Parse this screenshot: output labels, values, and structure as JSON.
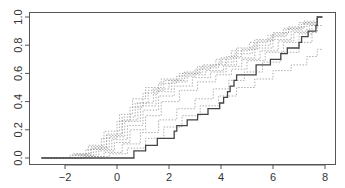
{
  "chart_data": {
    "type": "line",
    "subtype": "empirical-cdf-step",
    "title": "",
    "xlabel": "",
    "ylabel": "",
    "xlim": [
      -3.4,
      8.4
    ],
    "ylim": [
      -0.04,
      1.04
    ],
    "x_ticks": [
      -2,
      0,
      2,
      4,
      6,
      8
    ],
    "y_ticks": [
      0.0,
      0.2,
      0.4,
      0.6,
      0.8,
      1.0
    ],
    "x_tick_labels": [
      "−2",
      "0",
      "2",
      "4",
      "6",
      "8"
    ],
    "y_tick_labels": [
      "0.0",
      "0.2",
      "0.4",
      "0.6",
      "0.8",
      "1.0"
    ],
    "grid": false,
    "legend": null,
    "colors": {
      "axis": "#555555",
      "solid_series": "#444444",
      "dashed_series": "#9a9a9a"
    },
    "series": [
      {
        "name": "observed-ecdf",
        "style": "solid",
        "x": [
          -2.9,
          0.65,
          1.1,
          1.55,
          2.2,
          2.3,
          2.7,
          3.1,
          3.5,
          3.95,
          4.1,
          4.25,
          4.35,
          4.5,
          4.6,
          5.35,
          5.9,
          6.3,
          6.55,
          7.0,
          7.1,
          7.35,
          7.65,
          7.7
        ],
        "y": [
          0.0,
          0.05,
          0.09,
          0.14,
          0.19,
          0.23,
          0.27,
          0.31,
          0.35,
          0.39,
          0.43,
          0.47,
          0.51,
          0.55,
          0.59,
          0.66,
          0.7,
          0.74,
          0.78,
          0.82,
          0.86,
          0.9,
          0.94,
          1.0
        ]
      },
      {
        "name": "sim-1",
        "style": "dashed",
        "x": [
          -2.9,
          -1.8,
          -1.2,
          -0.6,
          0.0,
          0.5,
          1.0,
          1.6,
          2.3,
          3.0,
          3.6,
          4.2,
          4.8,
          5.4,
          6.0,
          6.6,
          7.2,
          7.7
        ],
        "y": [
          0.0,
          0.02,
          0.06,
          0.14,
          0.26,
          0.36,
          0.46,
          0.53,
          0.58,
          0.63,
          0.66,
          0.72,
          0.77,
          0.83,
          0.88,
          0.92,
          0.96,
          1.0
        ]
      },
      {
        "name": "sim-2",
        "style": "dashed",
        "x": [
          -2.9,
          -1.6,
          -1.0,
          -0.4,
          0.2,
          0.7,
          1.2,
          1.8,
          2.5,
          3.2,
          3.9,
          4.5,
          5.2,
          5.9,
          6.5,
          7.1,
          7.7
        ],
        "y": [
          0.0,
          0.03,
          0.08,
          0.17,
          0.29,
          0.39,
          0.48,
          0.55,
          0.6,
          0.64,
          0.68,
          0.74,
          0.8,
          0.86,
          0.91,
          0.95,
          1.0
        ]
      },
      {
        "name": "sim-3",
        "style": "dashed",
        "x": [
          -2.9,
          -1.5,
          -0.9,
          -0.3,
          0.3,
          0.9,
          1.5,
          2.1,
          2.7,
          3.4,
          4.1,
          4.6,
          5.3,
          6.0,
          6.7,
          7.3,
          7.7
        ],
        "y": [
          0.0,
          0.02,
          0.07,
          0.15,
          0.26,
          0.37,
          0.47,
          0.54,
          0.59,
          0.62,
          0.66,
          0.71,
          0.78,
          0.84,
          0.9,
          0.95,
          1.0
        ]
      },
      {
        "name": "sim-4",
        "style": "dashed",
        "x": [
          -2.9,
          -1.7,
          -1.1,
          -0.5,
          0.1,
          0.6,
          1.1,
          1.7,
          2.4,
          3.1,
          3.8,
          4.4,
          5.1,
          5.8,
          6.4,
          7.0,
          7.7
        ],
        "y": [
          0.0,
          0.03,
          0.09,
          0.19,
          0.31,
          0.42,
          0.5,
          0.56,
          0.6,
          0.65,
          0.7,
          0.76,
          0.82,
          0.87,
          0.92,
          0.96,
          1.0
        ]
      },
      {
        "name": "sim-5",
        "style": "dashed",
        "x": [
          -2.9,
          -1.4,
          -0.8,
          -0.2,
          0.4,
          1.0,
          1.6,
          2.2,
          2.9,
          3.6,
          4.2,
          4.8,
          5.5,
          6.2,
          6.8,
          7.4,
          7.7
        ],
        "y": [
          0.0,
          0.02,
          0.06,
          0.13,
          0.23,
          0.34,
          0.44,
          0.51,
          0.57,
          0.61,
          0.65,
          0.7,
          0.76,
          0.83,
          0.89,
          0.94,
          1.0
        ]
      },
      {
        "name": "sim-6",
        "style": "dashed",
        "x": [
          -2.9,
          -1.6,
          -1.0,
          -0.4,
          0.2,
          0.8,
          1.4,
          2.0,
          2.6,
          3.3,
          4.0,
          4.6,
          5.3,
          6.0,
          6.6,
          7.2,
          7.7
        ],
        "y": [
          0.0,
          0.02,
          0.07,
          0.16,
          0.27,
          0.39,
          0.49,
          0.55,
          0.61,
          0.66,
          0.71,
          0.78,
          0.84,
          0.89,
          0.93,
          0.97,
          1.0
        ]
      },
      {
        "name": "sim-7",
        "style": "dashed",
        "x": [
          -2.9,
          -1.3,
          -0.7,
          -0.1,
          0.5,
          1.1,
          1.7,
          2.4,
          3.1,
          3.8,
          4.4,
          5.0,
          5.7,
          6.4,
          7.0,
          7.5,
          7.7
        ],
        "y": [
          0.0,
          0.01,
          0.05,
          0.11,
          0.2,
          0.3,
          0.4,
          0.48,
          0.54,
          0.59,
          0.63,
          0.69,
          0.75,
          0.82,
          0.88,
          0.94,
          1.0
        ]
      },
      {
        "name": "sim-8",
        "style": "dashed",
        "x": [
          -2.9,
          -1.2,
          -0.5,
          0.2,
          0.9,
          1.6,
          2.3,
          3.0,
          3.7,
          4.3,
          4.9,
          5.6,
          6.3,
          7.0,
          7.5,
          7.7
        ],
        "y": [
          0.0,
          0.01,
          0.04,
          0.1,
          0.18,
          0.27,
          0.35,
          0.42,
          0.49,
          0.55,
          0.61,
          0.68,
          0.75,
          0.82,
          0.89,
          0.94
        ]
      },
      {
        "name": "sim-9",
        "style": "dashed",
        "x": [
          -2.9,
          -1.0,
          -0.3,
          0.4,
          1.1,
          1.8,
          2.5,
          3.2,
          3.9,
          4.6,
          5.3,
          6.0,
          6.7,
          7.3,
          7.7
        ],
        "y": [
          0.0,
          0.01,
          0.03,
          0.07,
          0.14,
          0.22,
          0.3,
          0.37,
          0.44,
          0.5,
          0.56,
          0.62,
          0.66,
          0.72,
          0.77
        ]
      }
    ]
  }
}
